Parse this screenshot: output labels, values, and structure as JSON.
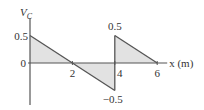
{
  "chart_data": {
    "type": "area",
    "title": "",
    "ylabel": "V",
    "ylabel_subscript": "C",
    "xlabel": "x (m)",
    "xlim": [
      0,
      6
    ],
    "ylim": [
      -0.5,
      0.5
    ],
    "grid": false,
    "series": [
      {
        "name": "segment-1",
        "x": [
          0,
          4
        ],
        "y": [
          0.5,
          -0.5
        ]
      },
      {
        "name": "segment-2",
        "x": [
          4,
          6
        ],
        "y": [
          0.5,
          0
        ]
      }
    ],
    "x_ticks": [
      {
        "value": 2,
        "label": "2"
      },
      {
        "value": 4,
        "label": "4"
      },
      {
        "value": 6,
        "label": "6"
      }
    ],
    "y_ticks": [
      {
        "value": 0,
        "label": "0"
      },
      {
        "value": 0.5,
        "label": "0.5"
      }
    ],
    "annotations": [
      {
        "x": 4,
        "y": 0.5,
        "label": "0.5"
      },
      {
        "x": 4,
        "y": -0.5,
        "label": "−0.5"
      }
    ],
    "colors": {
      "fill": "#e2e2e2",
      "line": "#555555",
      "axis": "#555555"
    }
  }
}
